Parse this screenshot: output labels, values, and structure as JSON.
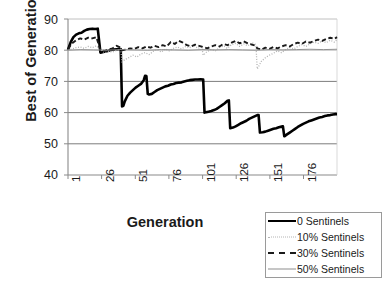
{
  "chart_data": {
    "type": "line",
    "title": "",
    "xlabel": "Generation",
    "ylabel": "Best of Generation",
    "xlim": [
      1,
      200
    ],
    "ylim": [
      40,
      90
    ],
    "grid": true,
    "grid_axis": "y",
    "legend_position": "bottom-right",
    "yticks": [
      90,
      80,
      70,
      60,
      50,
      40
    ],
    "xticks": [
      1,
      26,
      51,
      76,
      101,
      126,
      151,
      176
    ],
    "series": [
      {
        "name": "0 Sentinels",
        "style": "solid-thick",
        "color": "#000000",
        "x": [
          1,
          3,
          5,
          7,
          9,
          11,
          13,
          15,
          17,
          19,
          21,
          23,
          25,
          27,
          29,
          31,
          33,
          35,
          37,
          39,
          40,
          41,
          42,
          43,
          45,
          47,
          49,
          51,
          53,
          55,
          57,
          58,
          59,
          60,
          61,
          63,
          65,
          67,
          69,
          71,
          73,
          75,
          77,
          79,
          81,
          83,
          85,
          87,
          89,
          91,
          93,
          95,
          97,
          99,
          101,
          102,
          103,
          105,
          107,
          109,
          111,
          113,
          115,
          117,
          119,
          120,
          121,
          123,
          125,
          127,
          129,
          131,
          133,
          135,
          137,
          139,
          141,
          142,
          143,
          145,
          147,
          149,
          151,
          153,
          155,
          157,
          159,
          160,
          161,
          163,
          165,
          167,
          169,
          171,
          173,
          175,
          177,
          179,
          181,
          183,
          185,
          187,
          189,
          191,
          193,
          195,
          197,
          199,
          200
        ],
        "y": [
          80.2,
          82.6,
          84.2,
          85.0,
          85.4,
          85.6,
          86.2,
          86.6,
          86.8,
          86.9,
          86.8,
          86.9,
          79.2,
          79.4,
          79.6,
          79.8,
          80.1,
          80.2,
          80.3,
          80.4,
          80.4,
          62.0,
          62.2,
          63.6,
          65.4,
          66.4,
          67.2,
          68.0,
          68.6,
          69.2,
          70.4,
          71.8,
          71.7,
          66.0,
          65.8,
          66.0,
          66.6,
          67.2,
          67.6,
          68.0,
          68.4,
          68.6,
          69.0,
          69.2,
          69.5,
          69.6,
          69.7,
          70.0,
          70.2,
          70.4,
          70.5,
          70.6,
          70.6,
          70.7,
          70.6,
          60.0,
          60.1,
          60.3,
          60.5,
          60.8,
          61.2,
          61.8,
          62.4,
          63.0,
          63.8,
          63.9,
          55.0,
          55.2,
          55.6,
          56.1,
          56.6,
          57.0,
          57.4,
          58.0,
          58.4,
          58.8,
          59.2,
          59.2,
          53.6,
          53.7,
          53.9,
          54.2,
          54.5,
          54.8,
          55.0,
          55.3,
          55.5,
          55.6,
          52.4,
          53.0,
          53.6,
          54.2,
          54.8,
          55.4,
          55.9,
          56.4,
          56.8,
          57.2,
          57.5,
          57.8,
          58.1,
          58.4,
          58.6,
          58.9,
          59.1,
          59.2,
          59.4,
          59.5,
          59.5
        ]
      },
      {
        "name": "10% Sentinels",
        "style": "dotted",
        "color": "#b4b4b4",
        "x": [
          1,
          4,
          7,
          10,
          13,
          16,
          19,
          22,
          25,
          28,
          31,
          34,
          37,
          40,
          41,
          43,
          46,
          49,
          52,
          55,
          58,
          61,
          64,
          67,
          70,
          73,
          76,
          79,
          82,
          85,
          88,
          91,
          94,
          97,
          100,
          101,
          104,
          107,
          110,
          113,
          116,
          119,
          122,
          125,
          128,
          131,
          134,
          137,
          140,
          141,
          144,
          147,
          150,
          153,
          156,
          159,
          162,
          165,
          168,
          171,
          174,
          177,
          180,
          183,
          186,
          189,
          192,
          195,
          198,
          200
        ],
        "y": [
          80.0,
          80.4,
          80.8,
          81.0,
          80.6,
          81.2,
          80.8,
          81.4,
          80.2,
          79.2,
          79.6,
          79.4,
          80.0,
          80.3,
          76.2,
          77.0,
          77.6,
          78.4,
          77.8,
          78.8,
          79.2,
          78.6,
          79.6,
          80.2,
          79.4,
          80.4,
          79.8,
          80.6,
          81.0,
          80.4,
          81.2,
          80.8,
          81.6,
          80.6,
          81.0,
          78.4,
          79.6,
          80.2,
          79.8,
          80.8,
          81.4,
          80.6,
          81.8,
          82.2,
          81.2,
          82.0,
          81.4,
          82.4,
          81.8,
          74.0,
          76.4,
          77.6,
          78.4,
          79.0,
          79.8,
          79.2,
          80.2,
          80.8,
          80.4,
          81.2,
          81.8,
          81.2,
          82.0,
          82.6,
          82.2,
          83.0,
          82.4,
          83.2,
          82.6,
          83.4
        ]
      },
      {
        "name": "30% Sentinels",
        "style": "dashed",
        "color": "#1a1a1a",
        "x": [
          1,
          4,
          7,
          10,
          13,
          16,
          19,
          22,
          25,
          28,
          31,
          34,
          37,
          40,
          41,
          44,
          47,
          50,
          53,
          56,
          59,
          62,
          65,
          68,
          71,
          74,
          77,
          80,
          83,
          86,
          89,
          92,
          95,
          98,
          101,
          104,
          107,
          110,
          113,
          116,
          119,
          122,
          125,
          128,
          131,
          134,
          137,
          140,
          141,
          144,
          147,
          150,
          153,
          156,
          159,
          162,
          165,
          168,
          171,
          174,
          177,
          180,
          183,
          186,
          189,
          192,
          195,
          198,
          200
        ],
        "y": [
          80.4,
          82.2,
          83.2,
          83.8,
          83.4,
          84.0,
          83.8,
          84.2,
          80.0,
          79.8,
          80.2,
          80.6,
          81.4,
          80.8,
          80.0,
          80.2,
          80.6,
          80.4,
          81.0,
          80.6,
          81.2,
          80.8,
          81.4,
          81.0,
          81.6,
          81.2,
          82.6,
          82.0,
          83.0,
          82.4,
          81.6,
          81.2,
          81.8,
          81.4,
          81.0,
          80.6,
          81.2,
          81.6,
          81.2,
          82.0,
          81.6,
          82.4,
          83.0,
          82.2,
          82.8,
          82.2,
          81.8,
          81.4,
          80.6,
          80.2,
          80.8,
          80.4,
          81.0,
          80.6,
          81.2,
          81.6,
          81.2,
          82.0,
          82.4,
          82.0,
          82.8,
          82.4,
          83.0,
          83.4,
          83.0,
          83.6,
          84.0,
          83.6,
          84.2
        ]
      },
      {
        "name": "50% Sentinels",
        "style": "solid-thin",
        "color": "#8d8d8d",
        "x": [
          1,
          10,
          20,
          30,
          40,
          50,
          60,
          70,
          80,
          90,
          100,
          110,
          120,
          130,
          140,
          150,
          160,
          170,
          180,
          190,
          200
        ],
        "y": [
          80.0,
          80.2,
          80.1,
          80.0,
          80.2,
          80.1,
          80.0,
          80.2,
          80.1,
          80.0,
          80.2,
          80.1,
          80.2,
          80.1,
          80.0,
          80.2,
          80.1,
          80.2,
          80.3,
          80.2,
          80.3
        ]
      }
    ]
  },
  "axis": {
    "ylabel": "Best of Generation",
    "xlabel": "Generation",
    "yticks": [
      "90",
      "80",
      "70",
      "60",
      "50",
      "40"
    ],
    "xticks": [
      "1",
      "26",
      "51",
      "76",
      "101",
      "126",
      "151",
      "176"
    ]
  },
  "legend": {
    "items": [
      {
        "label": "0 Sentinels",
        "swatch": "line-solid-thick-icon"
      },
      {
        "label": "10% Sentinels",
        "swatch": "line-dotted-icon"
      },
      {
        "label": "30% Sentinels",
        "swatch": "line-dashed-icon"
      },
      {
        "label": "50% Sentinels",
        "swatch": "line-solid-thin-icon"
      }
    ]
  }
}
